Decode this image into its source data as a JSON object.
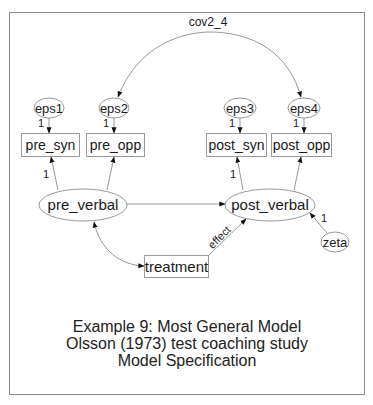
{
  "diagram": {
    "type": "SEM path diagram",
    "covariance_label": "cov2_4",
    "error_terms": [
      "eps1",
      "eps2",
      "eps3",
      "eps4"
    ],
    "observed": [
      "pre_syn",
      "pre_opp",
      "post_syn",
      "post_opp",
      "treatment"
    ],
    "latent": [
      "pre_verbal",
      "post_verbal"
    ],
    "disturbance": "zeta",
    "loadings": {
      "eps1_pre_syn": "1",
      "eps2_pre_opp": "1",
      "eps3_post_syn": "1",
      "eps4_post_opp": "1",
      "pre_verbal_pre_syn": "1",
      "post_verbal_post_syn": "1",
      "zeta_post_verbal": "1"
    },
    "effect_label": "effect"
  },
  "caption": {
    "line1": "Example 9: Most General Model",
    "line2": "Olsson (1973) test coaching study",
    "line3": "Model Specification"
  }
}
